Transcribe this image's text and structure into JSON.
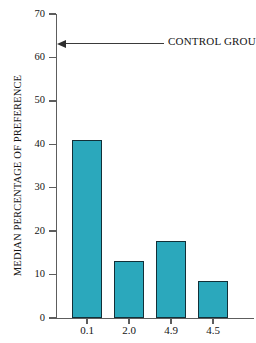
{
  "chart_data": {
    "type": "bar",
    "title": "",
    "xlabel": "",
    "ylabel": "MEDIAN PERCENTAGE OF PREFERENCE",
    "categories": [
      "0.1",
      "2.0",
      "4.9",
      "4.5"
    ],
    "values": [
      41.0,
      13.1,
      17.8,
      8.6
    ],
    "ylim": [
      0,
      70
    ],
    "yticks": [
      0,
      10,
      20,
      30,
      40,
      50,
      60,
      70
    ],
    "ytick_labels": [
      "0",
      "10",
      "20",
      "30",
      "40",
      "50",
      "60",
      "70"
    ],
    "grid": false,
    "legend": null,
    "bar_color": "#2ba8bc",
    "bar_edge_color": "#123038",
    "background_color": "#ffffff",
    "axis_color": "#5d5d5d",
    "annotations": [
      {
        "text": "CONTROL GROUP",
        "y_value": 63,
        "arrow_direction": "left",
        "arrow_target": "y-axis"
      }
    ]
  },
  "axis": {
    "y_title": "MEDIAN PERCENTAGE OF PREFERENCE"
  },
  "annotation": {
    "control_group_label": "CONTROL GROUP"
  }
}
